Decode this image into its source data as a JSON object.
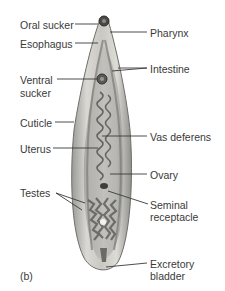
{
  "figure": {
    "panel_label": "(b)",
    "labels_left": [
      {
        "text": "Oral sucker"
      },
      {
        "text": "Esophagus"
      },
      {
        "text": "Ventral"
      },
      {
        "text": "sucker"
      },
      {
        "text": "Cuticle"
      },
      {
        "text": "Uterus"
      },
      {
        "text": "Testes"
      }
    ],
    "labels_right": [
      {
        "text": "Pharynx"
      },
      {
        "text": "Intestine"
      },
      {
        "text": "Vas deferens"
      },
      {
        "text": "Ovary"
      },
      {
        "text": "Seminal"
      },
      {
        "text": "receptacle"
      },
      {
        "text": "Excretory"
      },
      {
        "text": "bladder"
      }
    ]
  }
}
